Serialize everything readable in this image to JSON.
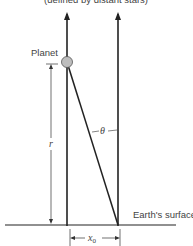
{
  "diagram": {
    "top_caption": "(defined by distant stars)",
    "planet_label": "Planet",
    "r_label": "r",
    "theta_label": "θ",
    "surface_label": "Earth's surface",
    "x0_label": "x",
    "x0_subscript": "0",
    "colors": {
      "line": "#222222",
      "planet_fill": "#bdbdbd",
      "text": "#444444"
    }
  }
}
